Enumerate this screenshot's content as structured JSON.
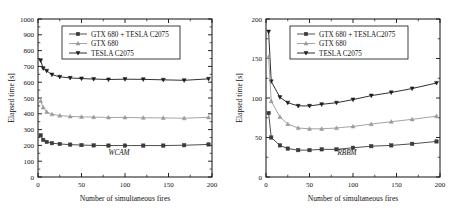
{
  "figure": {
    "panels": [
      {
        "id": "wcam",
        "annotation": "WCAM",
        "legend": [
          "GTX 680 + TESLA C2075",
          "GTX 680",
          "TESLA C2075"
        ],
        "chart_data": {
          "type": "line",
          "title": "",
          "subtitle": "",
          "annotation": "WCAM",
          "xlabel": "Number of simultaneous fires",
          "ylabel": "Elapsed time [s]",
          "xlim": [
            0,
            200
          ],
          "ylim": [
            0,
            1000
          ],
          "xticks": [
            0,
            50,
            100,
            150,
            200
          ],
          "yticks": [
            0,
            100,
            200,
            300,
            400,
            500,
            600,
            700,
            800,
            900,
            1000
          ],
          "xminor": [
            25,
            75,
            125,
            175
          ],
          "yminor": [
            50,
            150,
            250,
            350,
            450,
            550,
            650,
            750,
            850,
            950
          ],
          "grid": false,
          "legend_position": "top-center",
          "x": [
            3,
            6,
            10,
            16,
            25,
            37,
            50,
            64,
            81,
            100,
            121,
            144,
            168,
            196
          ],
          "series": [
            {
              "name": "TESLA C2075",
              "marker": "triangle-down",
              "color": "#1a1a1a",
              "values": [
                738,
                688,
                672,
                648,
                634,
                627,
                623,
                620,
                617,
                619,
                618,
                615,
                612,
                621
              ]
            },
            {
              "name": "GTX 680",
              "marker": "triangle-up",
              "color": "#9a9a9a",
              "values": [
                481,
                440,
                412,
                397,
                389,
                383,
                381,
                379,
                377,
                377,
                375,
                374,
                372,
                378
              ]
            },
            {
              "name": "GTX 680 + TESLA C2075",
              "marker": "square",
              "color": "#3a3a3a",
              "values": [
                264,
                235,
                222,
                214,
                209,
                205,
                202,
                200,
                199,
                199,
                199,
                199,
                201,
                206
              ]
            }
          ]
        }
      },
      {
        "id": "rbbm",
        "annotation": "RBBM",
        "legend": [
          "GTX 680 + TESLAC2075",
          "GTX 680",
          "TESLA C2075"
        ],
        "chart_data": {
          "type": "line",
          "title": "",
          "subtitle": "",
          "annotation": "RBBM",
          "xlabel": "Number of simultaneous fires",
          "ylabel": "Elapsed time [s]",
          "xlim": [
            0,
            200
          ],
          "ylim": [
            0,
            200
          ],
          "xticks": [
            0,
            50,
            100,
            150,
            200
          ],
          "yticks": [
            0,
            50,
            100,
            150,
            200
          ],
          "xminor": [
            25,
            75,
            125,
            175
          ],
          "yminor": [
            25,
            75,
            125,
            175
          ],
          "grid": false,
          "legend_position": "top-center",
          "x": [
            3,
            6,
            16,
            25,
            37,
            50,
            64,
            81,
            100,
            121,
            144,
            168,
            196
          ],
          "series": [
            {
              "name": "TESLA C2075",
              "marker": "triangle-down",
              "color": "#1a1a1a",
              "values": [
                184,
                121,
                101,
                94,
                90,
                90,
                92,
                94,
                98,
                103,
                107,
                112,
                119
              ]
            },
            {
              "name": "GTX 680",
              "marker": "triangle-up",
              "color": "#9a9a9a",
              "values": [
                152,
                96,
                76,
                67,
                62,
                61,
                61,
                62,
                64,
                67,
                70,
                73,
                77
              ]
            },
            {
              "name": "GTX 680 + TESLAC2075",
              "marker": "square",
              "color": "#3a3a3a",
              "values": [
                81,
                50,
                40,
                36,
                34,
                34,
                35,
                35,
                37,
                39,
                40,
                42,
                45
              ]
            }
          ]
        }
      }
    ]
  }
}
